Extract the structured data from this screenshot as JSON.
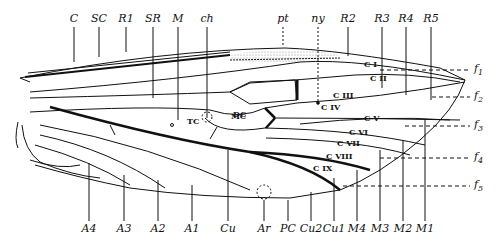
{
  "top_labels": [
    {
      "text": "C",
      "x": 74
    },
    {
      "text": "SC",
      "x": 99
    },
    {
      "text": "R1",
      "x": 126
    },
    {
      "text": "SR",
      "x": 153
    },
    {
      "text": "M",
      "x": 178
    },
    {
      "text": "ch",
      "x": 207
    },
    {
      "text": "pt",
      "x": 283
    },
    {
      "text": "ny",
      "x": 318
    },
    {
      "text": "R2",
      "x": 348
    },
    {
      "text": "R3",
      "x": 382
    },
    {
      "text": "R4",
      "x": 406
    },
    {
      "text": "R5",
      "x": 431
    }
  ],
  "bottom_labels": [
    {
      "text": "A4",
      "x": 89
    },
    {
      "text": "A3",
      "x": 124
    },
    {
      "text": "A2",
      "x": 158
    },
    {
      "text": "A1",
      "x": 192
    },
    {
      "text": "Cu",
      "x": 228
    },
    {
      "text": "Ar",
      "x": 264
    },
    {
      "text": "PC",
      "x": 288
    },
    {
      "text": "Cu2",
      "x": 311
    },
    {
      "text": "Cu1",
      "x": 334
    },
    {
      "text": "M4",
      "x": 357
    },
    {
      "text": "M3",
      "x": 380
    },
    {
      "text": "M2",
      "x": 403
    },
    {
      "text": "M1",
      "x": 425
    }
  ],
  "cells": [
    {
      "text": "DC",
      "x": 233,
      "y": 114
    },
    {
      "text": "TC",
      "x": 187,
      "y": 121
    },
    {
      "text": "MC",
      "x": 231,
      "y": 116
    },
    {
      "text": "C I",
      "x": 364,
      "y": 64
    },
    {
      "text": "C II",
      "x": 370,
      "y": 78
    },
    {
      "text": "C III",
      "x": 333,
      "y": 95
    },
    {
      "text": "C IV",
      "x": 321,
      "y": 107
    },
    {
      "text": "C V",
      "x": 364,
      "y": 118
    },
    {
      "text": "C VI",
      "x": 349,
      "y": 132
    },
    {
      "text": "C VII",
      "x": 337,
      "y": 143
    },
    {
      "text": "C VIII",
      "x": 326,
      "y": 156
    },
    {
      "text": "C IX",
      "x": 313,
      "y": 168
    }
  ],
  "field_labels": [
    {
      "text": "f",
      "sub": "1",
      "y": 70
    },
    {
      "text": "f",
      "sub": "2",
      "y": 97
    },
    {
      "text": "f",
      "sub": "3",
      "y": 126
    },
    {
      "text": "f",
      "sub": "4",
      "y": 158
    },
    {
      "text": "f",
      "sub": "5",
      "y": 186
    }
  ],
  "colors": {
    "ink": "#111111",
    "background": "#ffffff",
    "stipple": "#999999"
  }
}
